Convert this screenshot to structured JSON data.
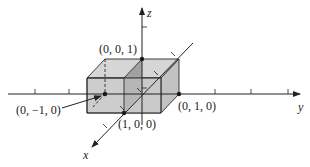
{
  "figure": {
    "type": "3d-coordinate-diagram"
  },
  "axes": {
    "x": {
      "label": "x"
    },
    "y": {
      "label": "y"
    },
    "z": {
      "label": "z"
    }
  },
  "points": [
    {
      "id": "p001",
      "label": "(0, 0, 1)"
    },
    {
      "id": "p010",
      "label": "(0, 1, 0)"
    },
    {
      "id": "p100",
      "label": "(1, 0, 0)"
    },
    {
      "id": "p0m10",
      "label": "(0, −1, 0)"
    }
  ],
  "colors": {
    "box_face": "#cfcfcf",
    "box_side": "#bdbdbd",
    "box_dark_face": "#9a9a9a",
    "stroke": "#2a2a2a"
  }
}
